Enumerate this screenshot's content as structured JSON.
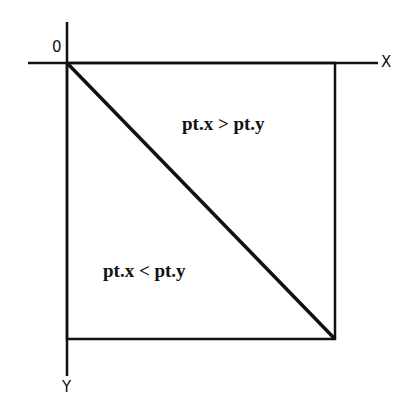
{
  "diagram": {
    "origin_label": "0",
    "x_axis_label": "X",
    "y_axis_label": "Y",
    "upper_region_label": "pt.x > pt.y",
    "lower_region_label": "pt.x < pt.y",
    "line_color": "#111111"
  }
}
